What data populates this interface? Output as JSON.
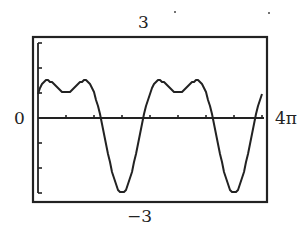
{
  "chart_data": {
    "type": "line",
    "title": "",
    "function": "y = 2 sin(x) + cos(2x)",
    "xlabel": "",
    "ylabel": "",
    "xlim": [
      0,
      12.566
    ],
    "ylim": [
      -3,
      3
    ],
    "x_tick_step": 1.5708,
    "y_tick_step": 1,
    "grid": false,
    "legend": null,
    "labels": {
      "ymax": "3",
      "ymin": "−3",
      "xmin": "0",
      "xmax": "4π"
    },
    "key_points": [
      {
        "x": 0,
        "y": 1.0
      },
      {
        "x": 0.5236,
        "y": 1.5,
        "note": "local max"
      },
      {
        "x": 1.5708,
        "y": 1.0,
        "note": "local min"
      },
      {
        "x": 2.618,
        "y": 1.5,
        "note": "local max"
      },
      {
        "x": 3.6652,
        "y": 0.0
      },
      {
        "x": 4.7124,
        "y": -3.0,
        "note": "minimum"
      },
      {
        "x": 5.7596,
        "y": 0.0
      },
      {
        "x": 6.8068,
        "y": 1.5,
        "note": "local max"
      },
      {
        "x": 7.854,
        "y": 1.0,
        "note": "local min"
      },
      {
        "x": 8.9012,
        "y": 1.5,
        "note": "local max"
      },
      {
        "x": 9.9484,
        "y": 0.0
      },
      {
        "x": 10.9956,
        "y": -3.0,
        "note": "minimum"
      },
      {
        "x": 12.0428,
        "y": 0.0
      },
      {
        "x": 12.566,
        "y": 1.0
      }
    ]
  },
  "colors": {
    "ink": "#222222",
    "background": "#ffffff"
  }
}
